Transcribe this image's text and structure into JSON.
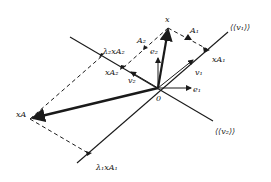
{
  "diagram": {
    "type": "vector-geometry",
    "origin_label": "0",
    "lines": [
      {
        "id": "v1-span",
        "label": "⟨⟨v₁⟩⟩"
      },
      {
        "id": "v2-span",
        "label": "⟨⟨v₂⟩⟩"
      }
    ],
    "vectors": {
      "x": "x",
      "e1": "e₁",
      "e2": "e₂",
      "v1": "v₁",
      "v2": "v₂",
      "xA": "xA"
    },
    "points": {
      "xA1": "xA₁",
      "xA2": "xA₂",
      "lambda1_xA1": "λ₁xA₁",
      "lambda2_xA2": "λ₂xA₂",
      "A1": "A₁",
      "A2": "A₂"
    },
    "colors": {
      "ink": "#1a1a1a",
      "background": "#ffffff"
    }
  }
}
